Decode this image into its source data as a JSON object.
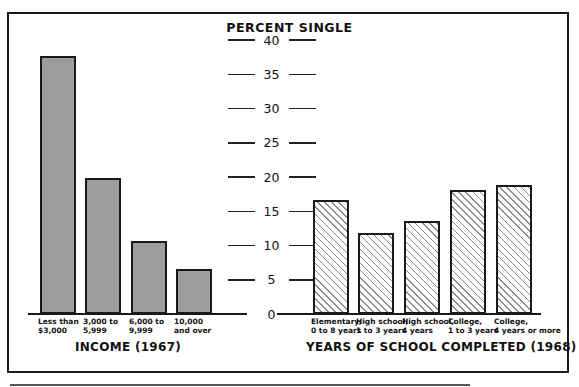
{
  "chart_data": [
    {
      "type": "bar",
      "title": "INCOME (1967)",
      "ylabel": "PERCENT SINGLE",
      "categories": [
        "Less than $3,000",
        "3,000 to 5,999",
        "6,000 to 9,999",
        "10,000 and over"
      ],
      "values": [
        37.7,
        19.8,
        10.7,
        6.6
      ],
      "ylim": [
        0,
        40
      ],
      "yticks": [
        0,
        5,
        10,
        15,
        20,
        25,
        30,
        35,
        40
      ],
      "fill": "solid gray",
      "grid": false
    },
    {
      "type": "bar",
      "title": "YEARS OF SCHOOL COMPLETED (1968)",
      "ylabel": "PERCENT SINGLE",
      "categories": [
        "Elementary, 0 to 8 years",
        "High school, 1 to 3 years",
        "High school, 4 years",
        "College, 1 to 3 years",
        "College, 4 years or more"
      ],
      "values": [
        16.6,
        11.8,
        13.6,
        18.1,
        18.8
      ],
      "ylim": [
        0,
        40
      ],
      "yticks": [
        0,
        5,
        10,
        15,
        20,
        25,
        30,
        35,
        40
      ],
      "fill": "diagonal hatch",
      "grid": false
    }
  ],
  "axis": {
    "title": "PERCENT SINGLE",
    "ticks": [
      "40",
      "35",
      "30",
      "25",
      "20",
      "15",
      "10",
      "5",
      "0"
    ]
  },
  "income": {
    "title": "INCOME (1967)",
    "labels": [
      "Less than\n$3,000",
      "3,000 to\n5,999",
      "6,000 to\n9,999",
      "10,000\nand over"
    ]
  },
  "school": {
    "title": "YEARS OF SCHOOL COMPLETED (1968)",
    "labels": [
      "Elementary,\n0 to 8 years",
      "High school,\n1 to 3 years",
      "High school,\n4 years",
      "College,\n1 to 3 years",
      "College,\n4 years or more"
    ]
  },
  "colors": {
    "solid_bar": "#9d9d9d",
    "hatch": "#8a8a8a",
    "outline": "#1a1a1a"
  }
}
